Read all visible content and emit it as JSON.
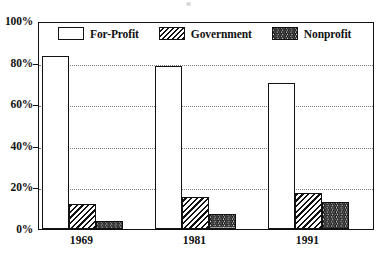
{
  "chart_data": {
    "type": "bar",
    "title": "",
    "subtitle": "",
    "xlabel": "",
    "ylabel": "",
    "categories": [
      "1969",
      "1981",
      "1991"
    ],
    "series": [
      {
        "name": "For-Profit",
        "values": [
          83,
          78.5,
          70
        ],
        "pattern": "solid-white"
      },
      {
        "name": "Government",
        "values": [
          12,
          15.5,
          17.5
        ],
        "pattern": "diagonal-hatch"
      },
      {
        "name": "Nonprofit",
        "values": [
          4,
          7,
          13
        ],
        "pattern": "zigzag-hatch"
      }
    ],
    "ylim": [
      0,
      100
    ],
    "yticks": [
      "0%",
      "20%",
      "40%",
      "60%",
      "80%",
      "100%"
    ],
    "ytick_values": [
      0,
      20,
      40,
      60,
      80,
      100
    ],
    "grid": true,
    "grid_style": "dotted-horizontal",
    "legend_position": "inside-top-center",
    "colors": {
      "ink": "#111111",
      "background": "#ffffff",
      "gridline": "#7a7a7a"
    }
  },
  "legend": {
    "items": [
      {
        "label": "For-Profit"
      },
      {
        "label": "Government"
      },
      {
        "label": "Nonprofit"
      }
    ]
  },
  "y_axis": {
    "ticks": [
      {
        "label": "100%",
        "value": 100
      },
      {
        "label": "80%",
        "value": 80
      },
      {
        "label": "60%",
        "value": 60
      },
      {
        "label": "40%",
        "value": 40
      },
      {
        "label": "20%",
        "value": 20
      },
      {
        "label": "0%",
        "value": 0
      }
    ]
  },
  "x_axis": {
    "ticks": [
      {
        "label": "1969"
      },
      {
        "label": "1981"
      },
      {
        "label": "1991"
      }
    ]
  }
}
